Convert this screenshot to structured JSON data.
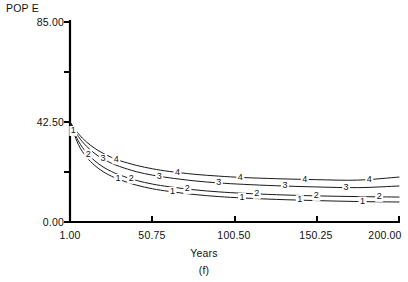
{
  "figure": {
    "caption": "(f)",
    "panel_label": "(f)"
  },
  "chart_data": {
    "type": "line",
    "title": "",
    "subtitle": "",
    "xlabel": "Years",
    "ylabel": "POP E",
    "ylabel_position": "top-left",
    "grid": false,
    "legend": "inline-curve-labels",
    "xlim": [
      1.0,
      200.0
    ],
    "ylim": [
      0.0,
      85.0
    ],
    "xticks": [
      1.0,
      50.75,
      100.5,
      150.25,
      200.0
    ],
    "xtick_labels": [
      "1.00",
      "50.75",
      "100.50",
      "150.25",
      "200.00"
    ],
    "yticks": [
      0.0,
      21.25,
      42.5,
      63.75,
      85.0
    ],
    "ytick_labels": [
      "0.00",
      "",
      "42.50",
      "",
      "85.00"
    ],
    "ytick_labels_shown": [
      "0.00",
      "42.50",
      "85.00"
    ],
    "x": [
      1,
      6,
      11,
      16,
      21,
      26,
      31,
      41,
      51,
      61,
      76,
      91,
      106,
      126,
      150,
      175,
      200
    ],
    "series": [
      {
        "name": "1",
        "label": "1",
        "values": [
          42.5,
          33.0,
          27.6,
          24.0,
          21.4,
          19.5,
          18.0,
          15.7,
          14.1,
          13.0,
          11.7,
          10.8,
          10.2,
          9.6,
          9.1,
          8.7,
          8.5
        ],
        "label_positions_x": [
          3,
          30,
          63,
          105,
          140,
          178
        ]
      },
      {
        "name": "2",
        "label": "2",
        "values": [
          42.5,
          34.5,
          29.5,
          26.0,
          23.4,
          21.5,
          20.0,
          17.7,
          16.1,
          15.0,
          13.7,
          12.8,
          12.2,
          11.6,
          11.1,
          10.8,
          10.6
        ],
        "label_positions_x": [
          12,
          38,
          72,
          114,
          150,
          188
        ]
      },
      {
        "name": "3",
        "label": "3",
        "values": [
          42.5,
          36.4,
          32.2,
          29.1,
          26.8,
          25.0,
          23.6,
          21.4,
          19.9,
          18.8,
          17.5,
          16.6,
          16.0,
          15.4,
          14.9,
          14.6,
          15.3
        ],
        "label_positions_x": [
          21,
          55,
          91,
          131,
          168
        ]
      },
      {
        "name": "4",
        "label": "4",
        "values": [
          42.5,
          37.6,
          34.0,
          31.3,
          29.2,
          27.5,
          26.1,
          24.1,
          22.6,
          21.5,
          20.3,
          19.5,
          18.9,
          18.4,
          18.0,
          17.8,
          19.1
        ],
        "label_positions_x": [
          29,
          66,
          104,
          143,
          182
        ]
      }
    ],
    "annotations": [
      {
        "text": "1",
        "series": "1"
      },
      {
        "text": "2",
        "series": "2"
      },
      {
        "text": "3",
        "series": "3"
      },
      {
        "text": "4",
        "series": "4"
      }
    ],
    "colors": {
      "curve": "#1a1a1a",
      "axis": "#000000",
      "background": "#ffffff"
    }
  }
}
